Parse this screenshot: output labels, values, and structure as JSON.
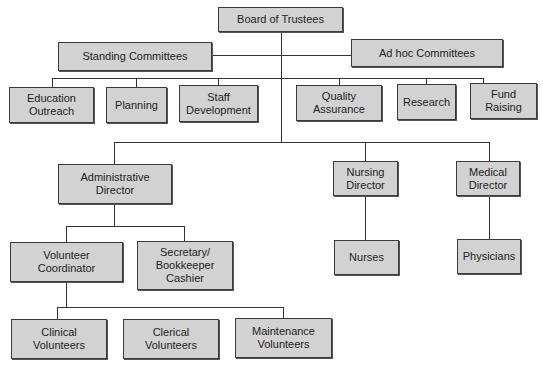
{
  "nodes": {
    "board": "Board of Trustees",
    "standing": "Standing Committees",
    "adhoc": "Ad hoc Committees",
    "education": "Education\nOutreach",
    "planning": "Planning",
    "staff": "Staff\nDevelopment",
    "quality": "Quality\nAssurance",
    "research": "Research",
    "fund": "Fund\nRaising",
    "admin": "Administrative\nDirector",
    "nursing": "Nursing\nDirector",
    "medical": "Medical\nDirector",
    "volunteer": "Volunteer\nCoordinator",
    "secretary": "Secretary/\nBookkeeper\nCashier",
    "nurses": "Nurses",
    "physicians": "Physicians",
    "clinical": "Clinical\nVolunteers",
    "clerical": "Clerical\nVolunteers",
    "maintenance": "Maintenance\nVolunteers"
  },
  "colors": {
    "box_fill": "#d2d2d2",
    "border": "#3a3a3a",
    "line": "#333333"
  }
}
